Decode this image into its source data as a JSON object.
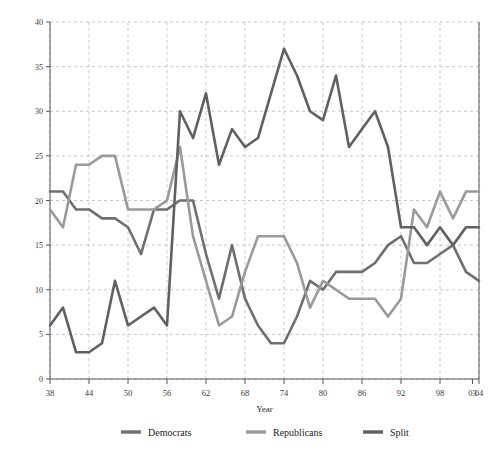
{
  "chart_data": {
    "type": "line",
    "title": "",
    "xlabel": "Year",
    "ylabel": "",
    "xlim": [
      1938,
      2004
    ],
    "ylim": [
      0,
      40
    ],
    "grid": true,
    "legend_position": "bottom",
    "x_tick_labels": [
      "38",
      "44",
      "50",
      "56",
      "62",
      "68",
      "74",
      "80",
      "86",
      "92",
      "98",
      "03",
      "04"
    ],
    "x_tick_values": [
      1938,
      1944,
      1950,
      1956,
      1962,
      1968,
      1974,
      1980,
      1986,
      1992,
      1998,
      2003,
      2004
    ],
    "y_tick_labels": [
      "0",
      "5",
      "10",
      "15",
      "20",
      "25",
      "30",
      "35",
      "40"
    ],
    "y_tick_values": [
      0,
      5,
      10,
      15,
      20,
      25,
      30,
      35,
      40
    ],
    "x": [
      1938,
      1940,
      1942,
      1944,
      1946,
      1948,
      1950,
      1952,
      1954,
      1956,
      1958,
      1960,
      1962,
      1964,
      1966,
      1968,
      1970,
      1972,
      1974,
      1976,
      1978,
      1980,
      1982,
      1984,
      1986,
      1988,
      1990,
      1992,
      1994,
      1996,
      1998,
      2000,
      2002,
      2004
    ],
    "series": [
      {
        "name": "Democrats",
        "color": "#6f6f6f",
        "values": [
          21,
          21,
          19,
          19,
          18,
          18,
          17,
          14,
          19,
          19,
          20,
          20,
          14,
          9,
          15,
          9,
          6,
          4,
          4,
          7,
          11,
          10,
          12,
          12,
          12,
          13,
          15,
          16,
          13,
          13,
          14,
          15,
          12,
          11
        ]
      },
      {
        "name": "Republicans",
        "color": "#9a9a9a",
        "values": [
          19,
          17,
          24,
          24,
          25,
          25,
          19,
          19,
          19,
          20,
          26,
          16,
          11,
          6,
          7,
          12,
          16,
          16,
          16,
          13,
          8,
          11,
          10,
          9,
          9,
          9,
          7,
          9,
          19,
          17,
          21,
          18,
          21,
          21
        ]
      },
      {
        "name": "Split",
        "color": "#606060",
        "values": [
          6,
          8,
          3,
          3,
          4,
          11,
          6,
          7,
          8,
          6,
          30,
          27,
          32,
          24,
          28,
          26,
          27,
          32,
          37,
          34,
          30,
          29,
          34,
          26,
          28,
          30,
          26,
          17,
          17,
          15,
          17,
          15,
          17,
          17
        ]
      }
    ]
  },
  "legend": {
    "items": [
      {
        "label": "Democrats"
      },
      {
        "label": "Republicans"
      },
      {
        "label": "Split"
      }
    ]
  },
  "axis": {
    "x_title": "Year"
  }
}
